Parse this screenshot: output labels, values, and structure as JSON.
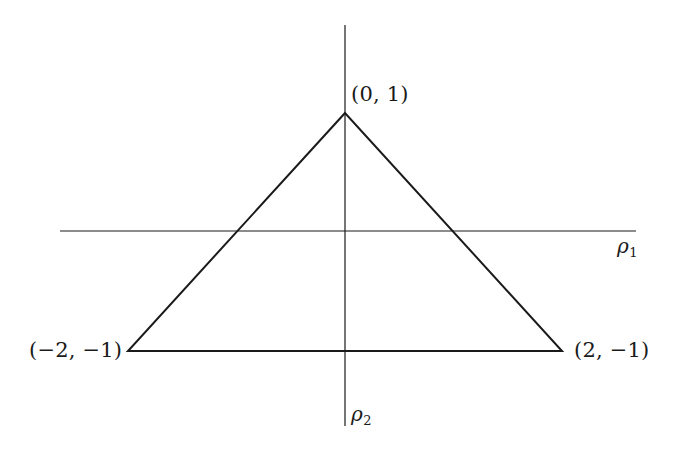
{
  "figure": {
    "background_color": "#ffffff",
    "stroke_color": "#1a1a1a",
    "text_color": "#1a1a1a",
    "axis_stroke_width": 1.2,
    "triangle_stroke_width": 2.0
  },
  "axes": {
    "horizontal": {
      "name": "rho-1-axis",
      "label": "ρ",
      "subscript": "1",
      "x_start": 60,
      "x_end": 636,
      "y": 231
    },
    "vertical": {
      "name": "rho-2-axis",
      "label": "ρ",
      "subscript": "2",
      "y_start": 25,
      "y_end": 426,
      "x": 345
    },
    "origin": {
      "x": 345,
      "y": 231
    }
  },
  "chart_data": {
    "type": "scatter",
    "title": "",
    "xlabel": "ρ1",
    "ylabel": "ρ2",
    "grid": false,
    "legend": null,
    "shape": "triangle",
    "vertices": [
      {
        "name": "apex",
        "label": "(0, 1)",
        "x": 0,
        "y": 1,
        "px": 345,
        "py": 113
      },
      {
        "name": "bottom-left",
        "label": "(−2, −1)",
        "x": -2,
        "y": -1,
        "px": 128,
        "py": 351
      },
      {
        "name": "bottom-right",
        "label": "(2, −1)",
        "x": 2,
        "y": -1,
        "px": 562,
        "py": 351
      }
    ],
    "edges": [
      {
        "from": "apex",
        "to": "bottom-left"
      },
      {
        "from": "bottom-left",
        "to": "bottom-right"
      },
      {
        "from": "bottom-right",
        "to": "apex"
      }
    ],
    "xlim": [
      -2.6,
      2.7
    ],
    "ylim": [
      -1.8,
      1.9
    ]
  },
  "labels": {
    "apex": "(0, 1)",
    "bottom_left": "(−2, −1)",
    "bottom_right": "(2, −1)",
    "rho1": "ρ",
    "rho1_sub": "1",
    "rho2": "ρ",
    "rho2_sub": "2"
  }
}
